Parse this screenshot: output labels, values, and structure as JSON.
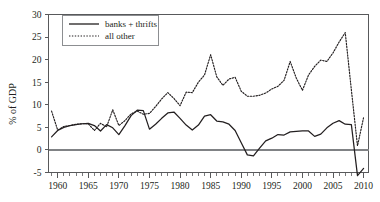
{
  "chart_data": {
    "type": "line",
    "title": "",
    "xlabel": "",
    "ylabel": "% of GDP",
    "xlim": [
      1958.5,
      2010.8
    ],
    "ylim": [
      -5,
      30
    ],
    "grid": false,
    "legend_position": "top-left",
    "y_ticks": [
      -5,
      0,
      5,
      10,
      15,
      20,
      25,
      30
    ],
    "y_tick_labels": [
      "-5",
      "0",
      "5",
      "10",
      "15",
      "20",
      "25",
      "30"
    ],
    "x_ticks": [
      1960,
      1965,
      1970,
      1975,
      1980,
      1985,
      1990,
      1995,
      2000,
      2005,
      2010
    ],
    "x_tick_labels": [
      "1960",
      "1965",
      "1970",
      "1975",
      "1980",
      "1985",
      "1990",
      "1995",
      "2000",
      "2005",
      "2010"
    ],
    "x_minor_tick_step": 1,
    "zero_line": 0,
    "series": [
      {
        "name": "banks + thrifts",
        "style": "solid",
        "color": "#231f20",
        "x": [
          1959,
          1960,
          1961,
          1962,
          1963,
          1964,
          1965,
          1966,
          1967,
          1968,
          1969,
          1970,
          1971,
          1972,
          1973,
          1974,
          1975,
          1976,
          1977,
          1978,
          1979,
          1980,
          1981,
          1982,
          1983,
          1984,
          1985,
          1986,
          1987,
          1988,
          1989,
          1990,
          1991,
          1992,
          1993,
          1994,
          1995,
          1996,
          1997,
          1998,
          1999,
          2000,
          2001,
          2002,
          2003,
          2004,
          2005,
          2006,
          2007,
          2008,
          2009,
          2010
        ],
        "values": [
          2.9,
          4.3,
          5.0,
          5.4,
          5.6,
          5.8,
          5.9,
          5.4,
          4.2,
          5.6,
          4.9,
          3.4,
          5.4,
          7.6,
          8.8,
          8.7,
          4.6,
          5.7,
          7.0,
          8.2,
          8.4,
          7.0,
          5.5,
          4.4,
          5.5,
          7.5,
          7.8,
          6.4,
          6.2,
          5.7,
          4.3,
          1.6,
          -1.1,
          -1.3,
          0.4,
          2.0,
          2.6,
          3.4,
          3.3,
          4.0,
          4.1,
          4.2,
          4.2,
          3.0,
          3.5,
          4.9,
          5.9,
          6.5,
          5.7,
          5.6,
          -5.7,
          -4.1
        ]
      },
      {
        "name": "all other",
        "style": "dotted",
        "color": "#231f20",
        "x": [
          1959,
          1960,
          1961,
          1962,
          1963,
          1964,
          1965,
          1966,
          1967,
          1968,
          1969,
          1970,
          1971,
          1972,
          1973,
          1974,
          1975,
          1976,
          1977,
          1978,
          1979,
          1980,
          1981,
          1982,
          1983,
          1984,
          1985,
          1986,
          1987,
          1988,
          1989,
          1990,
          1991,
          1992,
          1993,
          1994,
          1995,
          1996,
          1997,
          1998,
          1999,
          2000,
          2001,
          2002,
          2003,
          2004,
          2005,
          2006,
          2007,
          2008,
          2009,
          2010
        ],
        "values": [
          8.6,
          4.4,
          5.2,
          5.4,
          5.7,
          5.8,
          5.8,
          4.3,
          5.9,
          5.1,
          8.9,
          5.4,
          6.5,
          8.0,
          8.6,
          7.9,
          8.1,
          9.6,
          11.3,
          12.7,
          11.4,
          9.8,
          12.8,
          12.7,
          15.0,
          16.6,
          21.1,
          16.2,
          14.3,
          15.7,
          16.1,
          13.0,
          11.9,
          11.9,
          12.1,
          12.6,
          13.5,
          14.1,
          15.4,
          19.6,
          15.9,
          13.2,
          16.6,
          18.5,
          19.9,
          19.6,
          21.5,
          23.9,
          26.0,
          13.3,
          0.9,
          7.2
        ]
      }
    ]
  },
  "legend": {
    "entries": [
      {
        "label": "banks + thrifts",
        "style": "solid"
      },
      {
        "label": "all other",
        "style": "dotted"
      }
    ]
  },
  "axis": {
    "y_label": "% of GDP"
  }
}
